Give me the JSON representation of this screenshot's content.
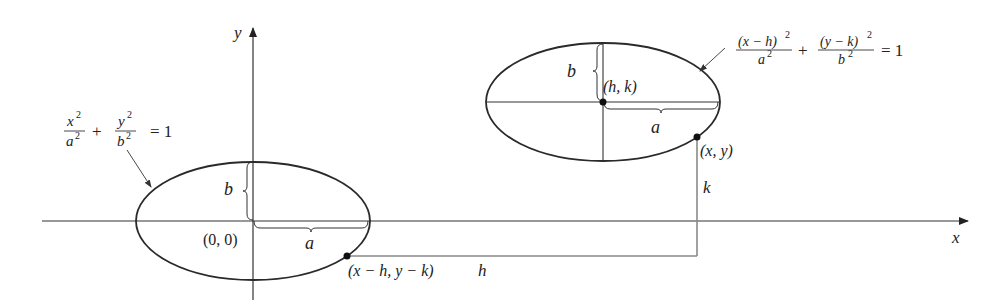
{
  "diagram": {
    "axes": {
      "x_label": "x",
      "y_label": "y",
      "origin_label": "(0, 0)"
    },
    "left_ellipse": {
      "equation": {
        "term1_num": "x",
        "term1_num_exp": "2",
        "term1_den": "a",
        "term1_den_exp": "2",
        "plus": "+",
        "term2_num": "y",
        "term2_num_exp": "2",
        "term2_den": "b",
        "term2_den_exp": "2",
        "rhs": "= 1"
      },
      "semi_major_label": "a",
      "semi_minor_label": "b",
      "point_label": "(x − h, y − k)"
    },
    "right_ellipse": {
      "equation": {
        "term1_num": "(x − h)",
        "term1_num_exp": "2",
        "term1_den": "a",
        "term1_den_exp": "2",
        "plus": "+",
        "term2_num": "(y − k)",
        "term2_num_exp": "2",
        "term2_den": "b",
        "term2_den_exp": "2",
        "rhs": "= 1"
      },
      "center_label": "(h, k)",
      "semi_major_label": "a",
      "semi_minor_label": "b",
      "point_label": "(x, y)"
    },
    "offsets": {
      "horizontal_label": "h",
      "vertical_label": "k"
    },
    "colors": {
      "curve": "#2a2a2a",
      "axis": "#333333",
      "guide": "#8a8a8a",
      "text": "#222222"
    }
  }
}
